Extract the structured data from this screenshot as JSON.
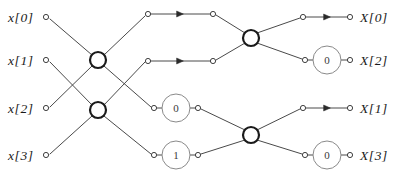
{
  "diagram": {
    "colors": {
      "line": "#4a4a4a",
      "node_stroke": "#2b2b2b",
      "butterfly_stroke": "#1a1a1a",
      "factor_stroke": "#8a8a8a",
      "text": "#1a1a1a",
      "background": "#ffffff"
    },
    "inputs": [
      {
        "label": "x[0]",
        "label_x": 8,
        "label_y": 11,
        "dot_x": 46,
        "dot_y": 17
      },
      {
        "label": "x[1]",
        "label_x": 8,
        "label_y": 54,
        "dot_x": 46,
        "dot_y": 60
      },
      {
        "label": "x[2]",
        "label_x": 8,
        "label_y": 102,
        "dot_x": 46,
        "dot_y": 108
      },
      {
        "label": "x[3]",
        "label_x": 8,
        "label_y": 149,
        "dot_x": 46,
        "dot_y": 155
      }
    ],
    "outputs": [
      {
        "label": "X[0]",
        "label_x": 360,
        "label_y": 11,
        "dot_x": 350,
        "dot_y": 17
      },
      {
        "label": "X[2]",
        "label_x": 360,
        "label_y": 54,
        "dot_x": 350,
        "dot_y": 60
      },
      {
        "label": "X[1]",
        "label_x": 360,
        "label_y": 102,
        "dot_x": 350,
        "dot_y": 108
      },
      {
        "label": "X[3]",
        "label_x": 360,
        "label_y": 149,
        "dot_x": 350,
        "dot_y": 155
      }
    ],
    "butterfly_nodes": [
      {
        "name": "stage1-upper",
        "x": 98,
        "y": 60,
        "r": 8
      },
      {
        "name": "stage1-lower",
        "x": 98,
        "y": 110,
        "r": 8
      },
      {
        "name": "stage2-upper",
        "x": 251,
        "y": 38,
        "r": 8
      },
      {
        "name": "stage2-lower",
        "x": 251,
        "y": 135,
        "r": 8
      }
    ],
    "twiddle_factors": [
      {
        "name": "stage1-row3",
        "value": "0",
        "x": 176,
        "y": 108,
        "r": 14
      },
      {
        "name": "stage1-row4",
        "value": "1",
        "x": 176,
        "y": 155,
        "r": 14
      },
      {
        "name": "stage2-row2",
        "value": "0",
        "x": 327,
        "y": 60,
        "r": 14
      },
      {
        "name": "stage2-row4",
        "value": "0",
        "x": 327,
        "y": 155,
        "r": 14
      }
    ],
    "stage1_out_dots": [
      {
        "x": 148,
        "y": 14
      },
      {
        "x": 148,
        "y": 61
      },
      {
        "x": 154,
        "y": 108
      },
      {
        "x": 154,
        "y": 155
      }
    ],
    "stage2_in_dots": [
      {
        "x": 213,
        "y": 14
      },
      {
        "x": 213,
        "y": 61
      },
      {
        "x": 198,
        "y": 108
      },
      {
        "x": 198,
        "y": 155
      }
    ],
    "stage2_out_dots": [
      {
        "x": 303,
        "y": 17
      },
      {
        "x": 305,
        "y": 60
      },
      {
        "x": 303,
        "y": 108
      },
      {
        "x": 305,
        "y": 155
      }
    ],
    "arrow_markers": [
      {
        "name": "arrow-row1-stage1",
        "x": 180,
        "y": 14
      },
      {
        "name": "arrow-row2-stage1",
        "x": 180,
        "y": 61
      },
      {
        "name": "arrow-row1-stage2",
        "x": 327,
        "y": 17
      },
      {
        "name": "arrow-row3-stage2",
        "x": 327,
        "y": 108
      }
    ],
    "edges": [
      {
        "name": "x0-to-s1u",
        "x1": 50,
        "y1": 19,
        "x2": 92,
        "y2": 55
      },
      {
        "name": "x1-to-s1l",
        "x1": 50,
        "y1": 62,
        "x2": 92,
        "y2": 105
      },
      {
        "name": "x2-to-s1u",
        "x1": 50,
        "y1": 107,
        "x2": 92,
        "y2": 66
      },
      {
        "name": "x3-to-s1l",
        "x1": 50,
        "y1": 154,
        "x2": 92,
        "y2": 116
      },
      {
        "name": "s1u-to-row1",
        "x1": 104,
        "y1": 55,
        "x2": 145,
        "y2": 16
      },
      {
        "name": "s1u-to-row3",
        "x1": 104,
        "y1": 66,
        "x2": 151,
        "y2": 107
      },
      {
        "name": "s1l-to-row2",
        "x1": 104,
        "y1": 105,
        "x2": 145,
        "y2": 62
      },
      {
        "name": "s1l-to-row4",
        "x1": 104,
        "y1": 116,
        "x2": 151,
        "y2": 154
      },
      {
        "name": "row1-horizontal",
        "x1": 150,
        "y1": 14,
        "x2": 211,
        "y2": 14
      },
      {
        "name": "row2-horizontal",
        "x1": 150,
        "y1": 61,
        "x2": 211,
        "y2": 61
      },
      {
        "name": "row3-wfac-in",
        "x1": 157,
        "y1": 108,
        "x2": 162,
        "y2": 108
      },
      {
        "name": "row3-wfac-out",
        "x1": 190,
        "y1": 108,
        "x2": 196,
        "y2": 108
      },
      {
        "name": "row4-wfac-in",
        "x1": 157,
        "y1": 155,
        "x2": 162,
        "y2": 155
      },
      {
        "name": "row4-wfac-out",
        "x1": 190,
        "y1": 155,
        "x2": 196,
        "y2": 155
      },
      {
        "name": "row1-to-s2u",
        "x1": 216,
        "y1": 15,
        "x2": 245,
        "y2": 33
      },
      {
        "name": "row2-to-s2u",
        "x1": 216,
        "y1": 60,
        "x2": 245,
        "y2": 43
      },
      {
        "name": "row3-to-s2l",
        "x1": 201,
        "y1": 109,
        "x2": 245,
        "y2": 130
      },
      {
        "name": "row4-to-s2l",
        "x1": 201,
        "y1": 154,
        "x2": 245,
        "y2": 140
      },
      {
        "name": "s2u-to-out1",
        "x1": 257,
        "y1": 33,
        "x2": 300,
        "y2": 18
      },
      {
        "name": "s2u-to-out2",
        "x1": 257,
        "y1": 43,
        "x2": 302,
        "y2": 59
      },
      {
        "name": "s2l-to-out3",
        "x1": 257,
        "y1": 130,
        "x2": 300,
        "y2": 109
      },
      {
        "name": "s2l-to-out4",
        "x1": 257,
        "y1": 140,
        "x2": 302,
        "y2": 154
      },
      {
        "name": "out1-horizontal",
        "x1": 306,
        "y1": 17,
        "x2": 348,
        "y2": 17
      },
      {
        "name": "out3-horizontal",
        "x1": 306,
        "y1": 108,
        "x2": 348,
        "y2": 108
      },
      {
        "name": "out2-wfac-in",
        "x1": 308,
        "y1": 60,
        "x2": 313,
        "y2": 60
      },
      {
        "name": "out2-wfac-out",
        "x1": 341,
        "y1": 60,
        "x2": 348,
        "y2": 60
      },
      {
        "name": "out4-wfac-in",
        "x1": 308,
        "y1": 155,
        "x2": 313,
        "y2": 155
      },
      {
        "name": "out4-wfac-out",
        "x1": 341,
        "y1": 155,
        "x2": 348,
        "y2": 155
      }
    ]
  }
}
